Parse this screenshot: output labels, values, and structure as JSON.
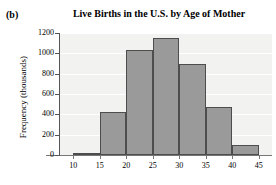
{
  "panel": {
    "label": "(b)"
  },
  "chart_data": {
    "type": "bar",
    "title": "Live Births in the U.S. by Age of Mother",
    "xlabel": "",
    "ylabel": "Frequency (thousands)",
    "categories": [
      "10-15",
      "15-20",
      "20-25",
      "25-30",
      "30-35",
      "35-40",
      "40-45"
    ],
    "bin_edges": [
      10,
      15,
      20,
      25,
      30,
      35,
      40,
      45
    ],
    "values": [
      22,
      425,
      1030,
      1150,
      900,
      475,
      100
    ],
    "xlim": [
      7.5,
      47.5
    ],
    "ylim": [
      0,
      1200
    ],
    "xticks": [
      10,
      15,
      20,
      25,
      30,
      35,
      40,
      45
    ],
    "yticks": [
      0,
      200,
      400,
      600,
      800,
      1000,
      1200
    ],
    "xticklabels": [
      "10",
      "15",
      "20",
      "25",
      "30",
      "35",
      "40",
      "45"
    ],
    "yticklabels": [
      "0",
      "200",
      "400",
      "600",
      "800",
      "1000",
      "1200"
    ],
    "grid": true,
    "legend": null,
    "bar_color": "#9a9a9a",
    "bar_edge_color": "#4d4d4d",
    "plot_background": "#f2f2f0",
    "gridline_color": "#ffffff"
  }
}
